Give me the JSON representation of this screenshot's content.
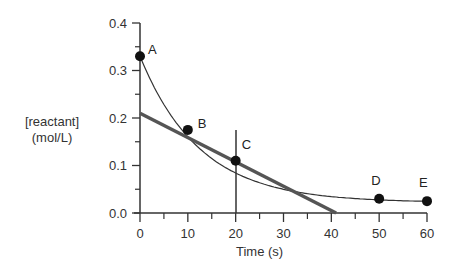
{
  "chart_data": {
    "type": "line",
    "title": "",
    "xlabel": "Time (s)",
    "ylabel_line1": "[reactant]",
    "ylabel_line2": "(mol/L)",
    "xlim": [
      0,
      60
    ],
    "ylim": [
      0,
      0.4
    ],
    "grid": false,
    "x_ticks": [
      "0",
      "10",
      "20",
      "30",
      "40",
      "50",
      "60"
    ],
    "y_ticks": [
      "0.0",
      "0.1",
      "0.2",
      "0.3",
      "0.4"
    ],
    "series": [
      {
        "name": "concentration curve",
        "x": [
          0,
          10,
          20,
          50,
          60
        ],
        "y": [
          0.33,
          0.175,
          0.11,
          0.03,
          0.025
        ]
      },
      {
        "name": "tangent at C",
        "x": [
          0,
          41
        ],
        "y": [
          0.21,
          0.0
        ]
      }
    ],
    "points": [
      {
        "label": "A",
        "x": 0,
        "y": 0.33
      },
      {
        "label": "B",
        "x": 10,
        "y": 0.175
      },
      {
        "label": "C",
        "x": 20,
        "y": 0.11
      },
      {
        "label": "D",
        "x": 50,
        "y": 0.03
      },
      {
        "label": "E",
        "x": 60,
        "y": 0.025
      }
    ],
    "annotations": [
      "vertical line at t = 20 s through C"
    ]
  }
}
